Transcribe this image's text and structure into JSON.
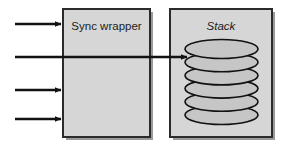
{
  "diagram": {
    "type": "block-diagram",
    "canvas": {
      "width": 284,
      "height": 146,
      "background": "#ffffff"
    },
    "colors": {
      "box_fill": "#d6d6d6",
      "box_border": "#2b2b2b",
      "box_shadow": "#9a9a9a",
      "ellipse_fill": "#c6c6c6",
      "ellipse_border": "#111111",
      "arrow": "#121212",
      "text": "#1b1b1b"
    },
    "boxes": [
      {
        "id": "sync-wrapper",
        "label": "Sync wrapper",
        "label_style": "normal",
        "x": 63,
        "y": 9,
        "width": 87,
        "height": 128
      },
      {
        "id": "stack",
        "label": "Stack",
        "label_style": "italic",
        "x": 170,
        "y": 9,
        "width": 102,
        "height": 128
      }
    ],
    "stack_elements": {
      "count": 6,
      "shape": "ellipse",
      "cx": 221.5,
      "rx": 36.5,
      "ry": 9.5,
      "first_cy": 49,
      "spacing": 13.2
    },
    "arrows": [
      {
        "id": "arrow-1",
        "x1": 15,
        "y1": 24,
        "x2": 62,
        "y2": 24,
        "label": ""
      },
      {
        "id": "arrow-2",
        "x1": 15,
        "y1": 57,
        "x2": 188,
        "y2": 57,
        "label": ""
      },
      {
        "id": "arrow-3",
        "x1": 15,
        "y1": 90,
        "x2": 62,
        "y2": 90,
        "label": ""
      },
      {
        "id": "arrow-4",
        "x1": 15,
        "y1": 119,
        "x2": 62,
        "y2": 119,
        "label": ""
      }
    ]
  }
}
